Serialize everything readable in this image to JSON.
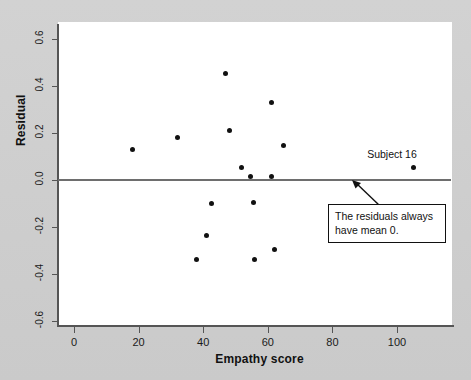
{
  "figure": {
    "background_color": "#cfcfcf",
    "plot_background_color": "#ffffff",
    "axis_color": "#555555",
    "marker_color": "#111111"
  },
  "annotations": {
    "subject_label": "Subject 16",
    "callout_text": "The residuals always have mean 0."
  },
  "chart_data": {
    "type": "scatter",
    "title": "",
    "xlabel": "Empathy score",
    "ylabel": "Residual",
    "xlim": [
      -5,
      116
    ],
    "ylim": [
      -0.74,
      0.72
    ],
    "xticks": [
      0,
      20,
      40,
      60,
      80,
      100
    ],
    "xtick_labels": [
      "0",
      "20",
      "40",
      "60",
      "80",
      "100"
    ],
    "yticks": [
      0.6,
      0.4,
      0.2,
      0.0,
      -0.2,
      -0.4,
      -0.6
    ],
    "ytick_labels": [
      "0.6",
      "0.4",
      "0.2",
      "0.0",
      "-0.2",
      "-0.4",
      "-0.6"
    ],
    "grid": false,
    "legend": false,
    "reference_line": {
      "orientation": "horizontal",
      "y": 0.0,
      "color": "#6e6e6e"
    },
    "points": [
      {
        "x": 18,
        "y": 0.13
      },
      {
        "x": 32,
        "y": 0.18
      },
      {
        "x": 38,
        "y": -0.34
      },
      {
        "x": 41,
        "y": -0.235
      },
      {
        "x": 42.5,
        "y": -0.1
      },
      {
        "x": 47,
        "y": 0.455
      },
      {
        "x": 48,
        "y": 0.21
      },
      {
        "x": 52,
        "y": 0.055
      },
      {
        "x": 54.5,
        "y": 0.015
      },
      {
        "x": 55.5,
        "y": -0.095
      },
      {
        "x": 56,
        "y": -0.34
      },
      {
        "x": 61,
        "y": 0.33
      },
      {
        "x": 61,
        "y": 0.015
      },
      {
        "x": 62,
        "y": -0.295
      },
      {
        "x": 65,
        "y": 0.145
      },
      {
        "x": 105,
        "y": 0.055,
        "label": "Subject 16"
      }
    ]
  }
}
